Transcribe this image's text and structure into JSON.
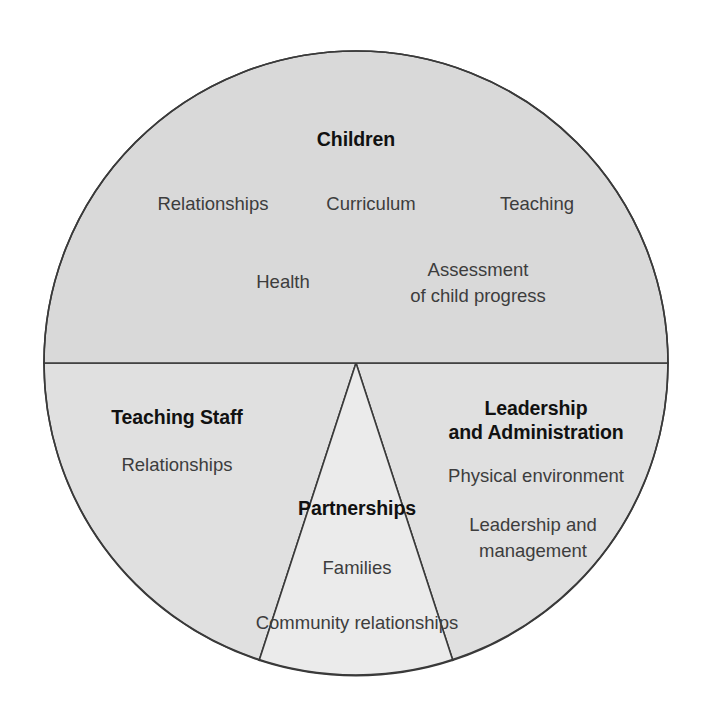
{
  "diagram": {
    "shape": "circle",
    "colors": {
      "background": "#ffffff",
      "top_half_fill": "#d9d9d9",
      "bottom_quadrant_fill": "#e0e0e0",
      "center_wedge_fill": "#ebebeb",
      "outline": "#3a3a3a",
      "heading_text": "#111111",
      "item_text": "#3d3d3d"
    },
    "geometry": {
      "center_x": 356,
      "center_y": 363,
      "radius": 312,
      "wedge_left_angle_deg": 198,
      "wedge_right_angle_deg": 342
    },
    "sections": [
      {
        "id": "children",
        "heading": "Children",
        "heading_x": 356,
        "heading_y": 141,
        "items": [
          {
            "lines": [
              "Relationships"
            ],
            "x": 213,
            "y": 205
          },
          {
            "lines": [
              "Curriculum"
            ],
            "x": 371,
            "y": 205
          },
          {
            "lines": [
              "Teaching"
            ],
            "x": 537,
            "y": 205
          },
          {
            "lines": [
              "Health"
            ],
            "x": 283,
            "y": 283
          },
          {
            "lines": [
              "Assessment",
              "of child progress"
            ],
            "x": 478,
            "y": 270
          }
        ]
      },
      {
        "id": "teaching-staff",
        "heading": "Teaching Staff",
        "heading_x": 177,
        "heading_y": 419,
        "items": [
          {
            "lines": [
              "Relationships"
            ],
            "x": 177,
            "y": 466
          }
        ]
      },
      {
        "id": "leadership-and-administration",
        "heading": "Leadership\nand Administration",
        "heading_lines": [
          "Leadership",
          "and Administration"
        ],
        "heading_x": 536,
        "heading_y": 410,
        "items": [
          {
            "lines": [
              "Physical environment"
            ],
            "x": 536,
            "y": 477
          },
          {
            "lines": [
              "Leadership and",
              "management"
            ],
            "x": 533,
            "y": 526
          }
        ]
      },
      {
        "id": "partnerships",
        "heading": "Partnerships",
        "heading_x": 357,
        "heading_y": 510,
        "items": [
          {
            "lines": [
              "Families"
            ],
            "x": 357,
            "y": 569
          },
          {
            "lines": [
              "Community relationships"
            ],
            "x": 357,
            "y": 624
          }
        ]
      }
    ]
  }
}
